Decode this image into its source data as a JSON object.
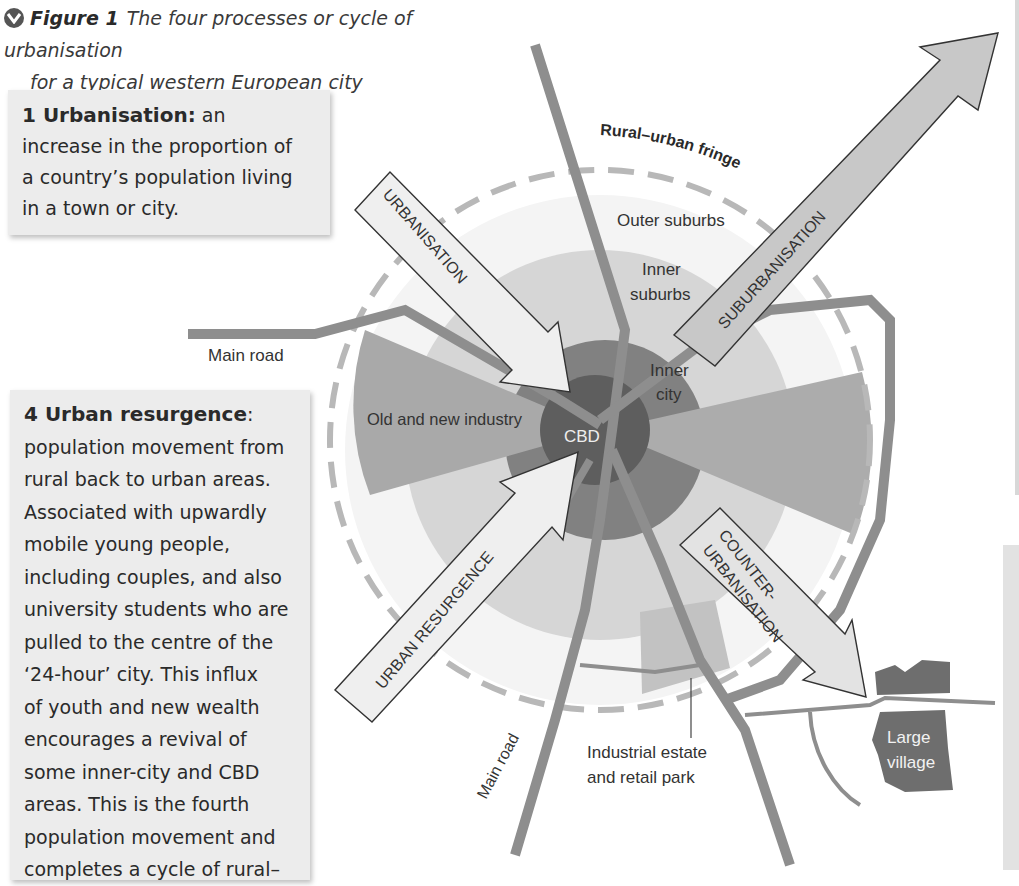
{
  "figure": {
    "icon": "chevron-down-circle-icon",
    "number": "Figure 1",
    "title_line1": "The four processes or cycle of urbanisation",
    "title_line2": "for a typical western European city"
  },
  "definitions": {
    "urbanisation": {
      "title": "1  Urbanisation:",
      "text_lines": [
        "an",
        "increase in the proportion of",
        "a country’s population living",
        "in a town or city."
      ]
    },
    "urban_resurgence": {
      "title": "4  Urban resurgence",
      "title_suffix": ":",
      "text_lines": [
        "population movement from",
        "rural back to urban areas.",
        "Associated with upwardly",
        "mobile young people,",
        "including couples, and also",
        "university students who are",
        "pulled to the centre of the",
        "‘24-hour’ city. This influx",
        "of youth and new wealth",
        "encourages a revival of",
        "some inner-city and CBD",
        "areas. This is the fourth",
        "population movement and",
        "completes a cycle of rural–"
      ]
    }
  },
  "diagram": {
    "zones": {
      "cbd": "CBD",
      "inner_city_1": "Inner",
      "inner_city_2": "city",
      "inner_suburbs_1": "Inner",
      "inner_suburbs_2": "suburbs",
      "outer_suburbs": "Outer suburbs",
      "fringe": "Rural–urban fringe",
      "industry": "Old and new industry"
    },
    "arrows": {
      "urbanisation": "URBANISATION",
      "suburbanisation": "SUBURBANISATION",
      "counter_1": "COUNTER-",
      "counter_2": "URBANISATION",
      "resurgence": "URBAN RESURGENCE"
    },
    "roads": {
      "main_road_west": "Main road",
      "main_road_south": "Main road"
    },
    "features": {
      "industrial_1": "Industrial estate",
      "industrial_2": "and retail park",
      "village_1": "Large",
      "village_2": "village"
    },
    "colors": {
      "cbd": "#5e5e5e",
      "inner_city": "#7d7d7d",
      "inner_suburbs": "#cfcfcf",
      "outer_suburbs": "#ececec",
      "industry": "#a8a8a8",
      "road": "#8e8e8e",
      "fringe_dash": "#b5b5b5",
      "arrow_fill_light": "#ececec",
      "arrow_fill_dark": "#c4c4c4",
      "village": "#6e6e6e"
    }
  }
}
